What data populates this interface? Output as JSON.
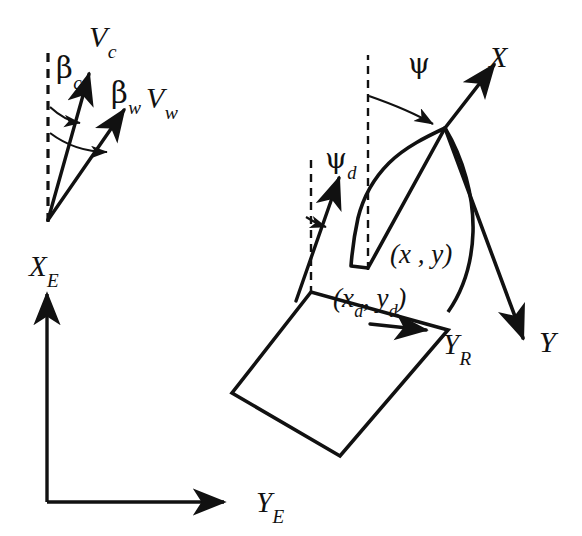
{
  "figure": {
    "background_color": "#ffffff",
    "stroke_color": "#111111",
    "width": 582,
    "height": 536
  },
  "labels": {
    "v_current": {
      "base": "V",
      "sub": "c"
    },
    "v_wind": {
      "base": "V",
      "sub": "w"
    },
    "beta_current": {
      "base": "β",
      "sub": "c"
    },
    "beta_wind": {
      "base": "β",
      "sub": "w"
    },
    "x_earth": {
      "base": "X",
      "sub": "E"
    },
    "y_earth": {
      "base": "Y",
      "sub": "E"
    },
    "psi": {
      "base": "ψ",
      "sub": ""
    },
    "psi_desired": {
      "base": "ψ",
      "sub": "d"
    },
    "x_body": {
      "base": "X",
      "sub": ""
    },
    "y_body": {
      "base": "Y",
      "sub": ""
    },
    "y_reference": {
      "base": "Y",
      "sub": "R"
    },
    "position_actual": "(x , y)",
    "position_desired_open": "(x",
    "position_desired_sub1": "d",
    "position_desired_mid": ", y",
    "position_desired_sub2": "d",
    "position_desired_close": ")"
  },
  "elements": {
    "environment_vectors": {
      "origin": [
        48,
        220
      ],
      "dashed_reference_axis": {
        "from": [
          48,
          220
        ],
        "to": [
          48,
          47
        ]
      },
      "current_vector": {
        "from": [
          48,
          220
        ],
        "to": [
          90,
          72
        ],
        "label": "V_c"
      },
      "wind_vector": {
        "from": [
          48,
          220
        ],
        "to": [
          126,
          108
        ],
        "label": "V_w"
      },
      "arc_beta_c": {
        "label": "β_c"
      },
      "arc_beta_w": {
        "label": "β_w"
      }
    },
    "earth_frame": {
      "origin": [
        47,
        502
      ],
      "x_axis": {
        "from": [
          47,
          502
        ],
        "to": [
          47,
          288
        ],
        "label": "X_E"
      },
      "y_axis": {
        "from": [
          47,
          502
        ],
        "to": [
          230,
          502
        ],
        "label": "Y_E"
      }
    },
    "desired_ship": {
      "reference_point": [
        311,
        292
      ],
      "heading_label": "ψ_d",
      "dashed_vertical": {
        "from": [
          311,
          292
        ],
        "to": [
          311,
          155
        ]
      },
      "heading_arrow": {
        "from": [
          296,
          300
        ],
        "to": [
          341,
          173
        ]
      },
      "hull_corners": [
        [
          311,
          292
        ],
        [
          232,
          393
        ],
        [
          340,
          456
        ],
        [
          448,
          330
        ]
      ]
    },
    "actual_ship": {
      "reference_point": [
        368,
        268
      ],
      "heading_label": "ψ",
      "dashed_vertical": {
        "from": [
          368,
          268
        ],
        "to": [
          368,
          55
        ]
      },
      "body_x_axis": {
        "from": [
          445,
          128
        ],
        "to": [
          496,
          62
        ],
        "label": "X"
      },
      "body_y_axis": {
        "from": [
          445,
          128
        ],
        "to": [
          527,
          340
        ],
        "label": "Y"
      },
      "rudder_axis_tip": [
        430,
        330
      ],
      "rudder_label": "Y_R"
    }
  },
  "annotations": {
    "notes": "Vertical dashed lines denote north (X_E) reference direction; psi and psi_d are heading angles measured from it."
  }
}
